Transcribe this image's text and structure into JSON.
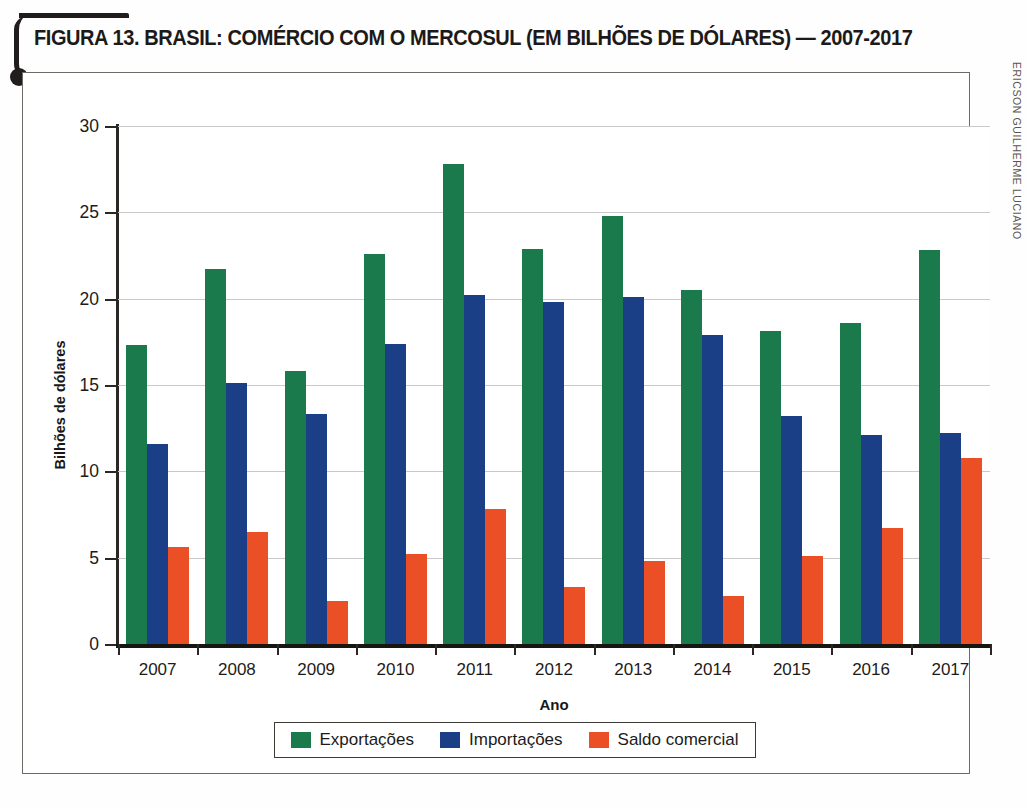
{
  "figure": {
    "title": "FIGURA 13. BRASIL: COMÉRCIO COM O MERCOSUL (EM BILHÕES DE DÓLARES) — 2007-2017",
    "credit": "ERICSON GUILHERME LUCIANO"
  },
  "chart_data": {
    "type": "bar",
    "title": "FIGURA 13. BRASIL: COMÉRCIO COM O MERCOSUL (EM BILHÕES DE DÓLARES) — 2007-2017",
    "xlabel": "Ano",
    "ylabel": "Bilhões de dólares",
    "ylim": [
      0,
      30
    ],
    "yticks": [
      0,
      5,
      10,
      15,
      20,
      25,
      30
    ],
    "ytick_labels": [
      "0",
      "5",
      "10",
      "15",
      "20",
      "25",
      "30"
    ],
    "grid": true,
    "legend_position": "bottom",
    "categories": [
      "2007",
      "2008",
      "2009",
      "2010",
      "2011",
      "2012",
      "2013",
      "2014",
      "2015",
      "2016",
      "2017"
    ],
    "series": [
      {
        "name": "Exportações",
        "color": "#1a7a4c",
        "values": [
          17.3,
          21.7,
          15.8,
          22.6,
          27.8,
          22.9,
          24.8,
          20.5,
          18.1,
          18.6,
          22.8
        ]
      },
      {
        "name": "Importações",
        "color": "#1b3f86",
        "values": [
          11.6,
          15.1,
          13.3,
          17.4,
          20.2,
          19.8,
          20.1,
          17.9,
          13.2,
          12.1,
          12.2
        ]
      },
      {
        "name": "Saldo comercial",
        "color": "#ea4f26",
        "values": [
          5.6,
          6.5,
          2.5,
          5.2,
          7.8,
          3.3,
          4.8,
          2.8,
          5.1,
          6.7,
          10.8
        ]
      }
    ]
  }
}
